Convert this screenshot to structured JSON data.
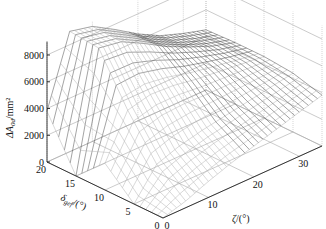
{
  "chart_data": {
    "type": "surface3d",
    "title": "",
    "zlabel": "ΔA_0d/mm²",
    "ylabel": "δ_gef/(°)",
    "xlabel": "ζ/(°)",
    "z_ticks": [
      "0",
      "2000",
      "4000",
      "6000",
      "8000"
    ],
    "delta_ticks": [
      "0",
      "5",
      "10",
      "15",
      "20"
    ],
    "zeta_ticks": [
      "0",
      "10",
      "20",
      "30"
    ],
    "zlim": [
      0,
      9000
    ],
    "delta_range": [
      0,
      20
    ],
    "zeta_range": [
      0,
      35
    ],
    "grid": true,
    "legend": null,
    "sample_surface": {
      "zeta": [
        0,
        5,
        10,
        15,
        20,
        25,
        30,
        35
      ],
      "delta": [
        0,
        5,
        10,
        15,
        20
      ],
      "z": [
        [
          0,
          500,
          1200,
          1800,
          2300,
          2800,
          3300,
          3800
        ],
        [
          0,
          2200,
          2800,
          3200,
          3500,
          3800,
          4100,
          4400
        ],
        [
          2000,
          5200,
          5600,
          5500,
          5200,
          5000,
          4800,
          4600
        ],
        [
          0,
          8800,
          8500,
          7600,
          6600,
          5800,
          5100,
          4600
        ],
        [
          3800,
          9000,
          8600,
          7600,
          6500,
          5600,
          5000,
          4500
        ]
      ]
    }
  },
  "axis_labels": {
    "z": "ΔA",
    "z_sub": "0d",
    "z_unit": "/mm²",
    "delta": "δ",
    "delta_sub": "gef",
    "delta_unit": "/(°)",
    "zeta": "ζ",
    "zeta_unit": "/(°)"
  }
}
